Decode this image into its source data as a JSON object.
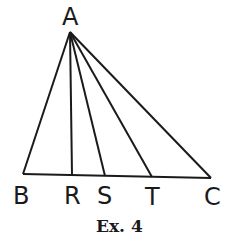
{
  "diagram": {
    "caption": "Ex. 4",
    "apex": {
      "label": "A",
      "x": 70,
      "y": 32
    },
    "base_points": [
      {
        "label": "B",
        "x": 23,
        "y": 174
      },
      {
        "label": "R",
        "x": 72,
        "y": 175
      },
      {
        "label": "S",
        "x": 105,
        "y": 176
      },
      {
        "label": "T",
        "x": 152,
        "y": 177
      },
      {
        "label": "C",
        "x": 211,
        "y": 178
      }
    ],
    "line_color": "#1a1a1a"
  }
}
